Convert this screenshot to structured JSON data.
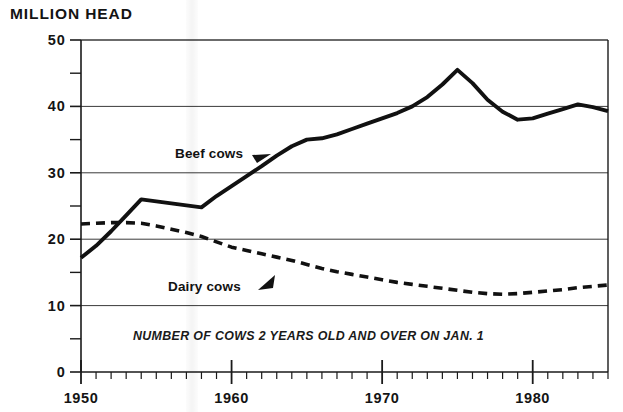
{
  "axis_title": "MILLION HEAD",
  "subtitle": "NUMBER OF COWS 2 YEARS OLD AND OVER ON JAN. 1",
  "labels": {
    "beef": "Beef cows",
    "dairy": "Dairy cows"
  },
  "chart_data": {
    "type": "line",
    "title": "MILLION HEAD",
    "subtitle": "NUMBER OF COWS 2 YEARS OLD AND OVER ON JAN. 1",
    "xlabel": "",
    "ylabel": "MILLION HEAD",
    "xlim": [
      1950,
      1985
    ],
    "ylim": [
      0,
      50
    ],
    "xticks": [
      1950,
      1960,
      1970,
      1980
    ],
    "xtick_labels": [
      "1950",
      "1960",
      "1970",
      "1980"
    ],
    "x_minor_tick_step": 1,
    "yticks": [
      0,
      10,
      20,
      30,
      40,
      50
    ],
    "ytick_labels": [
      "0",
      "10",
      "20",
      "30",
      "40",
      "50"
    ],
    "y_minor_ticks": [
      5,
      15,
      25,
      35,
      45
    ],
    "grid": "horizontal",
    "gridlines": [
      10,
      20,
      30,
      40,
      50
    ],
    "legend_position": "inline-annotations",
    "x": [
      1950,
      1951,
      1952,
      1953,
      1954,
      1955,
      1956,
      1957,
      1958,
      1959,
      1960,
      1961,
      1962,
      1963,
      1964,
      1965,
      1966,
      1967,
      1968,
      1969,
      1970,
      1971,
      1972,
      1973,
      1974,
      1975,
      1976,
      1977,
      1978,
      1979,
      1980,
      1981,
      1982,
      1983,
      1984,
      1985
    ],
    "series": [
      {
        "name": "Beef cows",
        "style": "solid",
        "color": "#111111",
        "values": [
          17.2,
          19.0,
          21.2,
          23.6,
          26.0,
          25.7,
          25.4,
          25.1,
          24.8,
          26.5,
          28.0,
          29.5,
          31.0,
          32.6,
          34.0,
          35.0,
          35.2,
          35.8,
          36.6,
          37.4,
          38.2,
          39.0,
          40.0,
          41.4,
          43.3,
          45.5,
          43.5,
          41.0,
          39.2,
          38.0,
          38.2,
          38.9,
          39.6,
          40.3,
          39.9,
          39.3
        ]
      },
      {
        "name": "Dairy cows",
        "style": "dashed",
        "color": "#111111",
        "values": [
          22.3,
          22.4,
          22.5,
          22.5,
          22.4,
          22.0,
          21.5,
          21.0,
          20.4,
          19.6,
          18.8,
          18.3,
          17.8,
          17.3,
          16.8,
          16.2,
          15.6,
          15.1,
          14.7,
          14.3,
          13.9,
          13.5,
          13.2,
          12.9,
          12.6,
          12.3,
          12.0,
          11.8,
          11.7,
          11.8,
          12.0,
          12.2,
          12.4,
          12.7,
          12.9,
          13.1
        ]
      }
    ]
  }
}
